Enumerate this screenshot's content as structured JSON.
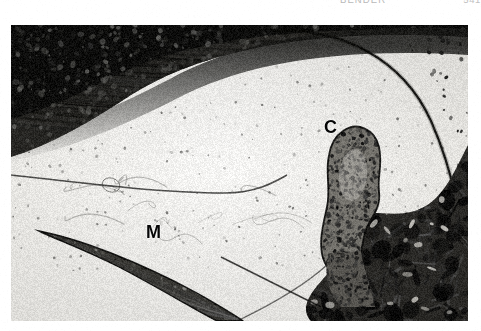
{
  "header": {
    "running_title": "BENDER",
    "page_number": "541",
    "clipped": true
  },
  "figure": {
    "type": "histological-micrograph",
    "plate_labels": [
      {
        "name": "label-c",
        "text": "C",
        "meaning": "cartilage",
        "x": 313,
        "y": 93
      },
      {
        "name": "label-m",
        "text": "M",
        "meaning": "membrane",
        "x": 135,
        "y": 198
      }
    ],
    "tone": {
      "paper": "#ffffff",
      "plate_background": "#f1f1ef",
      "tissue_light": "#e9e8e4",
      "tissue_mid": "#8f8d88",
      "tissue_dark": "#2a2926",
      "tissue_black": "#0d0d0c",
      "label_color": "#050505"
    },
    "regions": [
      {
        "name": "upper-lamellar-band",
        "description": "dark layered tissue band sweeping from upper-left to center"
      },
      {
        "name": "central-lumen",
        "description": "large pale cavity occupying centre of field"
      },
      {
        "name": "papillary-projection",
        "description": "finger-like cellular projection rising into the lumen at centre-right"
      },
      {
        "name": "lower-membrane",
        "description": "tapered elongated membrane running lower-left"
      },
      {
        "name": "right-dense-stroma",
        "description": "dense dark stromal mass filling lower-right quadrant"
      },
      {
        "name": "right-arc-margin",
        "description": "thin arcuate dark margin bounding the lumen on the right"
      }
    ]
  }
}
